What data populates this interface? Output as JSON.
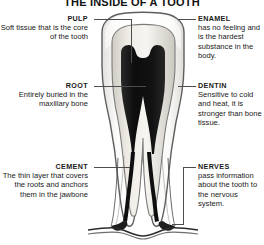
{
  "title": "THE INSIDE OF A TOOTH",
  "callouts": [
    {
      "id": "pulp",
      "term": "PULP",
      "desc": "Soft tissue that is the core of the tooth",
      "side": "left"
    },
    {
      "id": "root",
      "term": "ROOT",
      "desc": "Entirely buried in the maxillary bone",
      "side": "left"
    },
    {
      "id": "cement",
      "term": "CEMENT",
      "desc": "The thin layer that covers the roots and anchors them in the jawbone",
      "side": "left"
    },
    {
      "id": "enamel",
      "term": "ENAMEL",
      "desc": "has no feeling and is the hardest substance in the body.",
      "side": "right"
    },
    {
      "id": "dentin",
      "term": "DENTIN",
      "desc": "Sensitive to cold and heat, it is stronger than bone tissue.",
      "side": "right"
    },
    {
      "id": "nerves",
      "term": "NERVES",
      "desc": "pass information about the tooth to the nervous system.",
      "side": "right"
    }
  ],
  "illustration": {
    "name": "tooth-cross-section",
    "description": "Grayscale cross-section of a two-rooted molar showing enamel crown, dentin layer, dark pulp chamber and root canals, and jawbone line at the base",
    "colors": {
      "enamel": "#f2f2f0",
      "dentin": "#e6e3dd",
      "pulp": "#141414",
      "outline": "#5a5a5a",
      "leader": "#4d4d4d",
      "text": "#1a1a1a",
      "background": "#ffffff"
    }
  }
}
